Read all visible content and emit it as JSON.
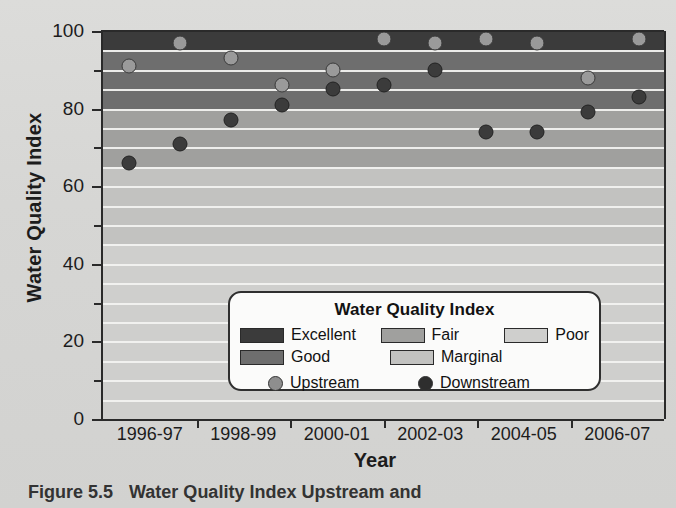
{
  "figure": {
    "caption_number": "Figure 5.5",
    "caption_text": "Water Quality Index Upstream and"
  },
  "axes": {
    "ylabel": "Water Quality Index",
    "xlabel": "Year",
    "ymin": 0,
    "ymax": 100,
    "ymajor_ticks": [
      0,
      20,
      40,
      60,
      80,
      100
    ],
    "yminor_ticks": [
      10,
      30,
      50,
      70,
      90
    ],
    "ytick_labels": [
      "0",
      "20",
      "40",
      "60",
      "80",
      "100"
    ],
    "xtick_labels": [
      "1996-97",
      "1998-99",
      "2000-01",
      "2002-03",
      "2004-05",
      "2006-07"
    ]
  },
  "legend": {
    "title": "Water Quality Index",
    "bands": [
      {
        "label": "Excellent",
        "color": "#3b3b3b"
      },
      {
        "label": "Fair",
        "color": "#a0a09e"
      },
      {
        "label": "Poor",
        "color": "#cfcfcd"
      },
      {
        "label": "Good",
        "color": "#6e6e6e"
      },
      {
        "label": "Marginal",
        "color": "#c2c2c0"
      }
    ],
    "series": [
      {
        "label": "Upstream",
        "color": "#8e8e8e"
      },
      {
        "label": "Downstream",
        "color": "#2e2e2e"
      }
    ]
  },
  "chart_data": {
    "type": "scatter",
    "xlabel": "Year",
    "ylabel": "Water Quality Index",
    "ylim": [
      0,
      100
    ],
    "grid": true,
    "legend_position": "inside lower-right",
    "x": [
      "1996-97",
      "1997-98",
      "1998-99",
      "1999-00",
      "2000-01",
      "2001-02",
      "2002-03",
      "2003-04",
      "2004-05",
      "2005-06",
      "2006-07"
    ],
    "series": [
      {
        "name": "Upstream",
        "color": "#8e8e8e",
        "values": [
          91,
          97,
          93,
          86,
          90,
          98,
          97,
          98,
          97,
          88,
          98
        ]
      },
      {
        "name": "Downstream",
        "color": "#2e2e2e",
        "values": [
          66,
          71,
          77,
          81,
          85,
          86,
          90,
          74,
          74,
          79,
          83
        ]
      }
    ],
    "bands": [
      {
        "label": "Excellent",
        "range": [
          95,
          100
        ],
        "color": "#3b3b3b"
      },
      {
        "label": "Good",
        "range": [
          80,
          95
        ],
        "color": "#6e6e6e"
      },
      {
        "label": "Fair",
        "range": [
          65,
          80
        ],
        "color": "#a0a09e"
      },
      {
        "label": "Marginal",
        "range": [
          45,
          65
        ],
        "color": "#c2c2c0"
      },
      {
        "label": "Poor",
        "range": [
          0,
          45
        ],
        "color": "#cfcfcd"
      }
    ],
    "gridline_interval": 5,
    "gridline_color": "#f2f2f0"
  }
}
